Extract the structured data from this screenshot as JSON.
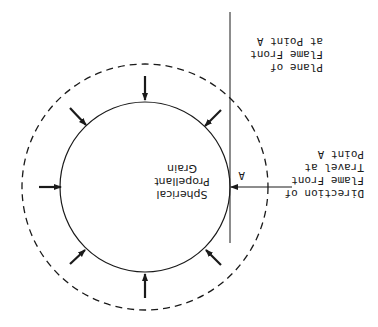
{
  "figure": {
    "orientation": "rotated 180 degrees",
    "colors": {
      "ink": "#1a1a1a",
      "background": "#ffffff"
    },
    "grain_label": [
      "Spherical",
      "Propellant",
      "Grain"
    ],
    "point_label": "A",
    "direction_label": [
      "Direction of",
      "Flame Front",
      "Travel at",
      "Point A"
    ],
    "plane_label": [
      "Plane of",
      "Flame Front",
      "at Point A"
    ]
  }
}
